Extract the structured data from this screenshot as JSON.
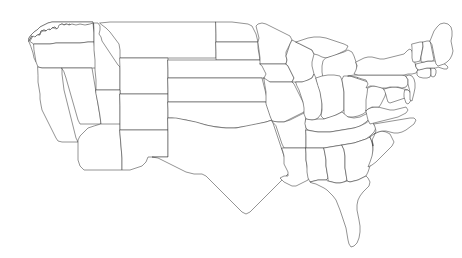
{
  "map": {
    "kind": "choropleth-base",
    "region": "United States",
    "projection": "albers-usa",
    "title": "",
    "subtitle": "",
    "legend": null,
    "labels_visible": false,
    "background_color": "#ffffff",
    "state_fill_color": "#ffffff",
    "border_color": "#3a3a3a",
    "border_width_px": 0.55,
    "width_px": 462,
    "height_px": 258,
    "states": [
      {
        "code": "WA",
        "name": "Washington",
        "fill": "#ffffff"
      },
      {
        "code": "OR",
        "name": "Oregon",
        "fill": "#ffffff"
      },
      {
        "code": "CA",
        "name": "California",
        "fill": "#ffffff"
      },
      {
        "code": "NV",
        "name": "Nevada",
        "fill": "#ffffff"
      },
      {
        "code": "ID",
        "name": "Idaho",
        "fill": "#ffffff"
      },
      {
        "code": "MT",
        "name": "Montana",
        "fill": "#ffffff"
      },
      {
        "code": "WY",
        "name": "Wyoming",
        "fill": "#ffffff"
      },
      {
        "code": "UT",
        "name": "Utah",
        "fill": "#ffffff"
      },
      {
        "code": "AZ",
        "name": "Arizona",
        "fill": "#ffffff"
      },
      {
        "code": "CO",
        "name": "Colorado",
        "fill": "#ffffff"
      },
      {
        "code": "NM",
        "name": "New Mexico",
        "fill": "#ffffff"
      },
      {
        "code": "ND",
        "name": "North Dakota",
        "fill": "#ffffff"
      },
      {
        "code": "SD",
        "name": "South Dakota",
        "fill": "#ffffff"
      },
      {
        "code": "NE",
        "name": "Nebraska",
        "fill": "#ffffff"
      },
      {
        "code": "KS",
        "name": "Kansas",
        "fill": "#ffffff"
      },
      {
        "code": "OK",
        "name": "Oklahoma",
        "fill": "#ffffff"
      },
      {
        "code": "TX",
        "name": "Texas",
        "fill": "#ffffff"
      },
      {
        "code": "MN",
        "name": "Minnesota",
        "fill": "#ffffff"
      },
      {
        "code": "IA",
        "name": "Iowa",
        "fill": "#ffffff"
      },
      {
        "code": "MO",
        "name": "Missouri",
        "fill": "#ffffff"
      },
      {
        "code": "AR",
        "name": "Arkansas",
        "fill": "#ffffff"
      },
      {
        "code": "LA",
        "name": "Louisiana",
        "fill": "#ffffff"
      },
      {
        "code": "WI",
        "name": "Wisconsin",
        "fill": "#ffffff"
      },
      {
        "code": "IL",
        "name": "Illinois",
        "fill": "#ffffff"
      },
      {
        "code": "MI",
        "name": "Michigan",
        "fill": "#ffffff"
      },
      {
        "code": "IN",
        "name": "Indiana",
        "fill": "#ffffff"
      },
      {
        "code": "OH",
        "name": "Ohio",
        "fill": "#ffffff"
      },
      {
        "code": "KY",
        "name": "Kentucky",
        "fill": "#ffffff"
      },
      {
        "code": "TN",
        "name": "Tennessee",
        "fill": "#ffffff"
      },
      {
        "code": "MS",
        "name": "Mississippi",
        "fill": "#ffffff"
      },
      {
        "code": "AL",
        "name": "Alabama",
        "fill": "#ffffff"
      },
      {
        "code": "GA",
        "name": "Georgia",
        "fill": "#ffffff"
      },
      {
        "code": "FL",
        "name": "Florida",
        "fill": "#ffffff"
      },
      {
        "code": "SC",
        "name": "South Carolina",
        "fill": "#ffffff"
      },
      {
        "code": "NC",
        "name": "North Carolina",
        "fill": "#ffffff"
      },
      {
        "code": "VA",
        "name": "Virginia",
        "fill": "#ffffff"
      },
      {
        "code": "WV",
        "name": "West Virginia",
        "fill": "#ffffff"
      },
      {
        "code": "MD",
        "name": "Maryland",
        "fill": "#ffffff"
      },
      {
        "code": "DE",
        "name": "Delaware",
        "fill": "#ffffff"
      },
      {
        "code": "PA",
        "name": "Pennsylvania",
        "fill": "#ffffff"
      },
      {
        "code": "NJ",
        "name": "New Jersey",
        "fill": "#ffffff"
      },
      {
        "code": "NY",
        "name": "New York",
        "fill": "#ffffff"
      },
      {
        "code": "CT",
        "name": "Connecticut",
        "fill": "#ffffff"
      },
      {
        "code": "RI",
        "name": "Rhode Island",
        "fill": "#ffffff"
      },
      {
        "code": "MA",
        "name": "Massachusetts",
        "fill": "#ffffff"
      },
      {
        "code": "VT",
        "name": "Vermont",
        "fill": "#ffffff"
      },
      {
        "code": "NH",
        "name": "New Hampshire",
        "fill": "#ffffff"
      },
      {
        "code": "ME",
        "name": "Maine",
        "fill": "#ffffff"
      }
    ]
  }
}
